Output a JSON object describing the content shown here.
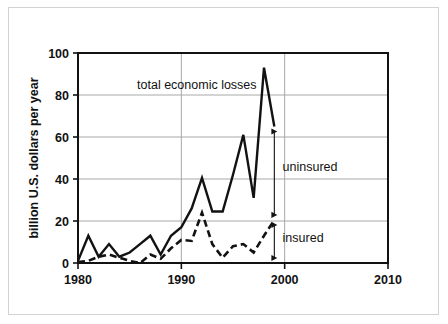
{
  "figure": {
    "frame_color": "#d2d2d2",
    "background": "#ffffff",
    "ink_color": "#121212",
    "grid_color": "#a8a8a8"
  },
  "chart_data": {
    "type": "line",
    "title": "",
    "subtitle": "",
    "xlabel": "",
    "ylabel": "billion U.S. dollars per year",
    "xlim": [
      1980,
      2010
    ],
    "ylim": [
      0,
      100
    ],
    "xticks": [
      1980,
      1990,
      2000,
      2010
    ],
    "xtick_labels": [
      "1980",
      "1990",
      "2000",
      "2010"
    ],
    "yticks": [
      0,
      20,
      40,
      60,
      80,
      100
    ],
    "ytick_labels": [
      "0",
      "20",
      "40",
      "60",
      "80",
      "100"
    ],
    "grid": "horizontal-and-vertical",
    "legend_position": "inline-annotations",
    "x": [
      1980,
      1981,
      1982,
      1983,
      1984,
      1985,
      1986,
      1987,
      1988,
      1989,
      1990,
      1991,
      1992,
      1993,
      1994,
      1995,
      1996,
      1997,
      1998,
      1999
    ],
    "series": [
      {
        "name": "total economic losses",
        "style": "solid",
        "values": [
          1,
          13,
          3,
          9,
          3,
          5,
          9,
          13,
          4,
          13,
          17,
          26,
          40.5,
          24.5,
          24.5,
          42,
          61,
          31,
          93,
          65
        ]
      },
      {
        "name": "insured losses",
        "style": "dashed",
        "values": [
          0.5,
          1,
          3,
          4,
          2.5,
          1,
          0,
          4,
          2,
          7,
          11,
          10.5,
          24,
          9,
          2.5,
          8,
          9,
          5,
          13,
          20.5
        ]
      }
    ],
    "annotations": [
      {
        "name": "total economic losses",
        "text": "total economic losses",
        "x": 1991.5,
        "y": 85
      },
      {
        "name": "uninsured",
        "text": "uninsured",
        "x": 1999.8,
        "y": 46,
        "arrow": {
          "type": "double-headed-vertical",
          "x": 1999,
          "y_top": 65,
          "y_bottom": 20.5
        }
      },
      {
        "name": "insured",
        "text": "insured",
        "x": 1999.8,
        "y": 12,
        "arrow": {
          "type": "double-headed-vertical",
          "x": 1999,
          "y_top": 20.5,
          "y_bottom": 0
        }
      }
    ]
  }
}
